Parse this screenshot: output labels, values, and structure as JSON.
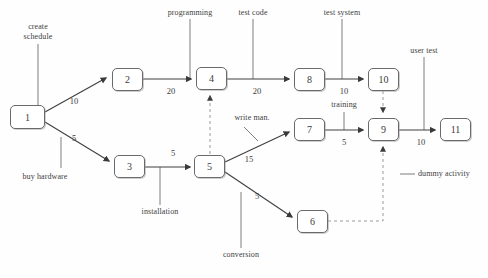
{
  "diagram": {
    "type": "pert-cpm-network",
    "colors": {
      "node_stroke": "#6a6a6a",
      "node_fill": "#ffffff",
      "edge": "#4a4a4a",
      "dashed_edge": "#9a9a9a",
      "text": "#404040",
      "background": "#fefefe"
    },
    "nodes": [
      {
        "id": "1",
        "label": "1",
        "x": 10,
        "y": 105,
        "w": 35,
        "h": 24
      },
      {
        "id": "2",
        "label": "2",
        "x": 112,
        "y": 68,
        "w": 31,
        "h": 23
      },
      {
        "id": "3",
        "label": "3",
        "x": 114,
        "y": 155,
        "w": 31,
        "h": 23
      },
      {
        "id": "4",
        "label": "4",
        "x": 196,
        "y": 67,
        "w": 31,
        "h": 23
      },
      {
        "id": "5",
        "label": "5",
        "x": 194,
        "y": 155,
        "w": 31,
        "h": 23
      },
      {
        "id": "6",
        "label": "6",
        "x": 297,
        "y": 210,
        "w": 31,
        "h": 23
      },
      {
        "id": "7",
        "label": "7",
        "x": 294,
        "y": 118,
        "w": 31,
        "h": 23
      },
      {
        "id": "8",
        "label": "8",
        "x": 294,
        "y": 68,
        "w": 31,
        "h": 23
      },
      {
        "id": "9",
        "label": "9",
        "x": 368,
        "y": 118,
        "w": 31,
        "h": 23
      },
      {
        "id": "10",
        "label": "10",
        "x": 368,
        "y": 68,
        "w": 31,
        "h": 23
      },
      {
        "id": "11",
        "label": "11",
        "x": 440,
        "y": 118,
        "w": 31,
        "h": 23
      }
    ],
    "edges": [
      {
        "from": "1",
        "to": "2",
        "duration": "10",
        "style": "solid"
      },
      {
        "from": "1",
        "to": "3",
        "duration": "5",
        "style": "solid"
      },
      {
        "from": "2",
        "to": "4",
        "duration": "20",
        "style": "solid"
      },
      {
        "from": "4",
        "to": "8",
        "duration": "20",
        "style": "solid"
      },
      {
        "from": "3",
        "to": "5",
        "duration": "5",
        "style": "solid"
      },
      {
        "from": "5",
        "to": "7",
        "duration": "15",
        "style": "solid"
      },
      {
        "from": "5",
        "to": "6",
        "duration": "5",
        "style": "solid"
      },
      {
        "from": "7",
        "to": "9",
        "duration": "5",
        "style": "solid"
      },
      {
        "from": "8",
        "to": "10",
        "duration": "10",
        "style": "solid"
      },
      {
        "from": "9",
        "to": "11",
        "duration": "10",
        "style": "solid"
      },
      {
        "from": "5",
        "to": "4",
        "duration": "",
        "style": "dashed"
      },
      {
        "from": "10",
        "to": "9",
        "duration": "",
        "style": "dashed"
      },
      {
        "from": "6",
        "to": "9",
        "duration": "",
        "style": "dashed"
      }
    ],
    "durations": [
      {
        "name": "duration-1-2",
        "value": "10",
        "x": 74,
        "y": 96
      },
      {
        "name": "duration-1-3",
        "value": "5",
        "x": 74,
        "y": 133
      },
      {
        "name": "duration-2-4",
        "value": "20",
        "x": 171,
        "y": 86
      },
      {
        "name": "duration-4-8",
        "value": "20",
        "x": 257,
        "y": 86
      },
      {
        "name": "duration-3-5",
        "value": "5",
        "x": 173,
        "y": 148
      },
      {
        "name": "duration-5-7",
        "value": "15",
        "x": 249,
        "y": 154
      },
      {
        "name": "duration-5-6",
        "value": "5",
        "x": 257,
        "y": 191
      },
      {
        "name": "duration-7-9",
        "value": "5",
        "x": 344,
        "y": 137
      },
      {
        "name": "duration-8-10",
        "value": "10",
        "x": 344,
        "y": 86
      },
      {
        "name": "duration-9-11",
        "value": "10",
        "x": 421,
        "y": 137
      }
    ],
    "labels": [
      {
        "name": "label-create-schedule",
        "text": "create\nschedule",
        "x": 38,
        "y": 27,
        "anchor": "center",
        "lines": [
          "create",
          "schedule"
        ]
      },
      {
        "name": "label-programming",
        "text": "programming",
        "x": 190,
        "y": 10,
        "anchor": "center",
        "lines": [
          "programming"
        ]
      },
      {
        "name": "label-test-code",
        "text": "test code",
        "x": 253,
        "y": 10,
        "anchor": "center",
        "lines": [
          "test code"
        ]
      },
      {
        "name": "label-test-system",
        "text": "test system",
        "x": 342,
        "y": 10,
        "anchor": "center",
        "lines": [
          "test system"
        ]
      },
      {
        "name": "label-user-test",
        "text": "user test",
        "x": 424,
        "y": 48,
        "anchor": "center",
        "lines": [
          "user test"
        ]
      },
      {
        "name": "label-buy-hardware",
        "text": "buy hardware",
        "x": 45,
        "y": 176,
        "anchor": "center",
        "lines": [
          "buy hardware"
        ]
      },
      {
        "name": "label-installation",
        "text": "installation",
        "x": 160,
        "y": 214,
        "anchor": "center",
        "lines": [
          "installation"
        ]
      },
      {
        "name": "label-conversion",
        "text": "conversion",
        "x": 241,
        "y": 257,
        "anchor": "center",
        "lines": [
          "conversion"
        ]
      },
      {
        "name": "label-write-man",
        "text": "write man.",
        "x": 248,
        "y": 118,
        "anchor": "center",
        "lines": [
          "write man."
        ]
      },
      {
        "name": "label-training",
        "text": "training",
        "x": 344,
        "y": 104,
        "anchor": "center",
        "lines": [
          "training"
        ]
      },
      {
        "name": "label-dummy-activity",
        "text": "dummy activity",
        "x": 448,
        "y": 174,
        "anchor": "center",
        "lines": [
          "dummy activity"
        ]
      }
    ]
  }
}
